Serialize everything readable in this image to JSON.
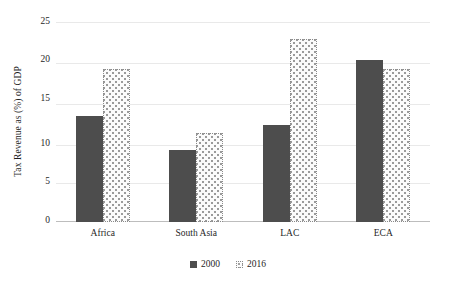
{
  "chart_data": {
    "type": "bar",
    "title": "",
    "xlabel": "",
    "ylabel": "Tax Revenue as (%) of GDP",
    "ylim": [
      0,
      25
    ],
    "yticks": [
      0,
      5,
      10,
      15,
      20,
      25
    ],
    "grid": true,
    "legend_position": "bottom-center",
    "categories": [
      "Africa",
      "South Asia",
      "LAC",
      "ECA"
    ],
    "series": [
      {
        "name": "2000",
        "values": [
          13.1,
          8.9,
          12.0,
          19.9
        ],
        "color": "#4d4d4d",
        "pattern": "solid"
      },
      {
        "name": "2016",
        "values": [
          18.9,
          11.0,
          22.5,
          18.9
        ],
        "color": "#fbfbfb",
        "pattern": "dotted"
      }
    ]
  },
  "legend": {
    "items": [
      {
        "label": "2000",
        "swatch": "solid-dark-square-icon"
      },
      {
        "label": "2016",
        "swatch": "dotted-light-square-icon"
      }
    ]
  }
}
